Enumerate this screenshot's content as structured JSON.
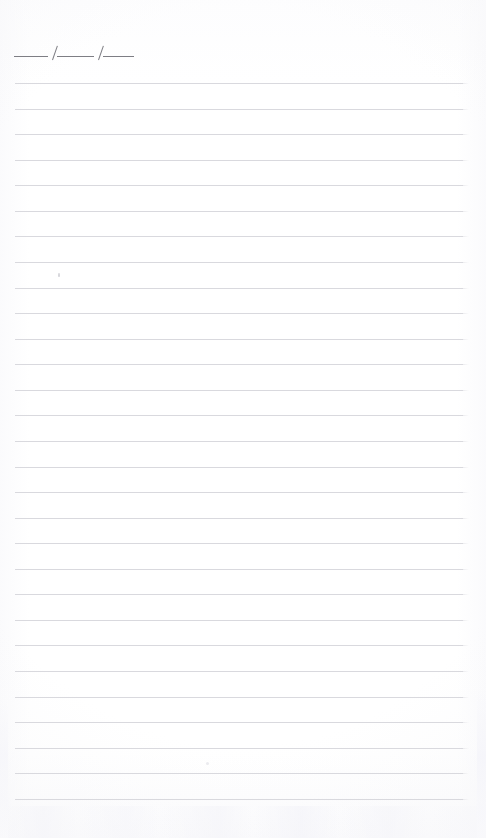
{
  "page": {
    "kind": "scanned-blank-lined-notebook-page",
    "width": 486,
    "height": 838,
    "background_color": "#ffffff"
  },
  "date_field": {
    "label": "___/___/___",
    "placeholder": "",
    "value": "",
    "segments": [
      "___",
      "___",
      "___"
    ],
    "separators": [
      "/",
      "/"
    ],
    "ink_color": "#7e7e84"
  },
  "ruled_area": {
    "line_color": "#d9d9de",
    "line_count": 29,
    "first_line_y": 83,
    "line_spacing": 25.6,
    "left_inset": 15,
    "right_edge": 463,
    "lines": [
      {
        "index": 1,
        "y": 83,
        "text": ""
      },
      {
        "index": 2,
        "y": 109,
        "text": ""
      },
      {
        "index": 3,
        "y": 134,
        "text": ""
      },
      {
        "index": 4,
        "y": 160,
        "text": ""
      },
      {
        "index": 5,
        "y": 185,
        "text": ""
      },
      {
        "index": 6,
        "y": 211,
        "text": ""
      },
      {
        "index": 7,
        "y": 236,
        "text": ""
      },
      {
        "index": 8,
        "y": 262,
        "text": ""
      },
      {
        "index": 9,
        "y": 288,
        "text": ""
      },
      {
        "index": 10,
        "y": 313,
        "text": ""
      },
      {
        "index": 11,
        "y": 339,
        "text": ""
      },
      {
        "index": 12,
        "y": 364,
        "text": ""
      },
      {
        "index": 13,
        "y": 390,
        "text": ""
      },
      {
        "index": 14,
        "y": 415,
        "text": ""
      },
      {
        "index": 15,
        "y": 441,
        "text": ""
      },
      {
        "index": 16,
        "y": 467,
        "text": ""
      },
      {
        "index": 17,
        "y": 492,
        "text": ""
      },
      {
        "index": 18,
        "y": 518,
        "text": ""
      },
      {
        "index": 19,
        "y": 543,
        "text": ""
      },
      {
        "index": 20,
        "y": 569,
        "text": ""
      },
      {
        "index": 21,
        "y": 594,
        "text": ""
      },
      {
        "index": 22,
        "y": 620,
        "text": ""
      },
      {
        "index": 23,
        "y": 645,
        "text": ""
      },
      {
        "index": 24,
        "y": 671,
        "text": ""
      },
      {
        "index": 25,
        "y": 697,
        "text": ""
      },
      {
        "index": 26,
        "y": 722,
        "text": ""
      },
      {
        "index": 27,
        "y": 748,
        "text": ""
      },
      {
        "index": 28,
        "y": 773,
        "text": ""
      },
      {
        "index": 29,
        "y": 799,
        "text": ""
      }
    ]
  }
}
